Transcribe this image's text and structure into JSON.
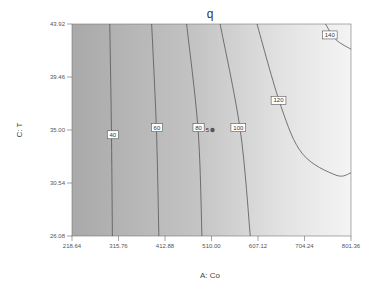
{
  "chart_data": {
    "type": "contour",
    "title": "q",
    "xlabel": "A: Co",
    "ylabel": "C: T",
    "xlim": [
      218.64,
      801.36
    ],
    "ylim": [
      26.08,
      43.92
    ],
    "x_ticks": [
      "218.64",
      "315.76",
      "412.88",
      "510.00",
      "607.12",
      "704.24",
      "801.36"
    ],
    "y_ticks": [
      "43.92",
      "39.46",
      "35.00",
      "30.54",
      "26.08"
    ],
    "grid": false,
    "legend": null,
    "contour_levels": [
      40,
      60,
      80,
      100,
      120,
      140
    ],
    "contour_labels": [
      "40",
      "60",
      "80",
      "100",
      "120",
      "140"
    ],
    "contours": [
      {
        "level": 40,
        "points": [
          [
            297.5,
            43.92
          ],
          [
            301.0,
            35.0
          ],
          [
            303.0,
            26.08
          ]
        ]
      },
      {
        "level": 60,
        "points": [
          [
            385.0,
            43.92
          ],
          [
            395.0,
            35.0
          ],
          [
            400.0,
            26.08
          ]
        ]
      },
      {
        "level": 80,
        "points": [
          [
            458.0,
            43.92
          ],
          [
            482.0,
            35.0
          ],
          [
            490.0,
            26.08
          ]
        ]
      },
      {
        "level": 100,
        "points": [
          [
            528.0,
            43.92
          ],
          [
            570.0,
            35.0
          ],
          [
            591.0,
            26.08
          ]
        ]
      },
      {
        "level": 120,
        "points": [
          [
            605.0,
            43.92
          ],
          [
            655.0,
            37.0
          ],
          [
            700.0,
            33.0
          ],
          [
            770.0,
            31.2
          ],
          [
            801.36,
            31.4
          ]
        ]
      },
      {
        "level": 140,
        "points": [
          [
            748.0,
            43.92
          ],
          [
            770.0,
            42.6
          ],
          [
            801.36,
            41.8
          ]
        ]
      }
    ],
    "design_point": {
      "x": 510.0,
      "y": 35.0,
      "count_label": "5"
    },
    "color_scale": {
      "low": "#a9a9a9",
      "high": "#f4f4f4"
    }
  }
}
